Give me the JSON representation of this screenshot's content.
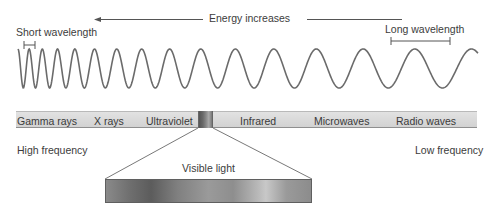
{
  "diagram": {
    "energy_arrow": {
      "label": "Energy increases",
      "direction": "left"
    },
    "wave": {
      "short_label": "Short wavelength",
      "long_label": "Long wavelength",
      "color": "#6b6b6b"
    },
    "spectrum_bands": [
      {
        "label": "Gamma rays"
      },
      {
        "label": "X rays"
      },
      {
        "label": "Ultraviolet"
      },
      {
        "label": "Infrared"
      },
      {
        "label": "Microwaves"
      },
      {
        "label": "Radio waves"
      }
    ],
    "frequency": {
      "high": "High frequency",
      "low": "Low frequency"
    },
    "visible_light": {
      "label": "Visible light"
    }
  }
}
